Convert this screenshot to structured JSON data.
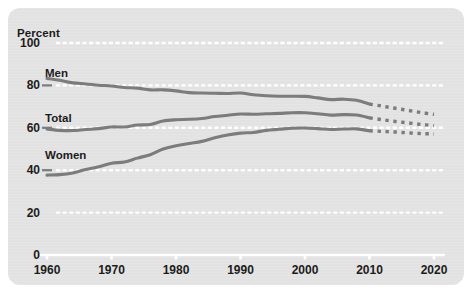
{
  "panel": {
    "background_color": "#e3e3e3",
    "border_radius": 12
  },
  "chart_data": {
    "type": "line",
    "title": "",
    "subtitle": "",
    "xlabel": "",
    "ylabel": "Percent",
    "ylim": [
      0,
      100
    ],
    "xlim": [
      1960,
      2020
    ],
    "grid": true,
    "grid_style": "dotted",
    "grid_color": "#ffffff",
    "legend_position": "inline-labels",
    "yticks": [
      100,
      80,
      60,
      40,
      20,
      0
    ],
    "ytick_labels": [
      "100",
      "80",
      "60",
      "40",
      "20",
      "0"
    ],
    "xticks": [
      1960,
      1970,
      1980,
      1990,
      2000,
      2010,
      2020
    ],
    "xtick_labels": [
      "1960",
      "1970",
      "1980",
      "1990",
      "2000",
      "2010",
      "2020"
    ],
    "line_color": "#7c7c7c",
    "projection_note": "dotted segments from 2010 to 2020 are projections",
    "series": [
      {
        "name": "Men",
        "label": "Men",
        "color": "#7c7c7c",
        "x": [
          1960,
          1962,
          1964,
          1966,
          1968,
          1970,
          1972,
          1974,
          1976,
          1978,
          1980,
          1982,
          1984,
          1986,
          1988,
          1990,
          1992,
          1994,
          1996,
          1998,
          2000,
          2002,
          2004,
          2006,
          2008,
          2010
        ],
        "values": [
          83.3,
          82.4,
          81.2,
          80.7,
          80.1,
          79.7,
          79.0,
          78.7,
          77.9,
          77.9,
          77.4,
          76.6,
          76.4,
          76.3,
          76.2,
          76.4,
          75.6,
          75.1,
          74.9,
          74.9,
          74.8,
          74.1,
          73.3,
          73.5,
          73.0,
          71.2
        ],
        "projection_x": [
          2010,
          2012,
          2014,
          2016,
          2018,
          2020
        ],
        "projection_values": [
          71.2,
          70.2,
          69.2,
          68.2,
          67.2,
          66.3
        ]
      },
      {
        "name": "Total",
        "label": "Total",
        "color": "#7c7c7c",
        "x": [
          1960,
          1962,
          1964,
          1966,
          1968,
          1970,
          1972,
          1974,
          1976,
          1978,
          1980,
          1982,
          1984,
          1986,
          1988,
          1990,
          1992,
          1994,
          1996,
          1998,
          2000,
          2002,
          2004,
          2006,
          2008,
          2010
        ],
        "values": [
          59.4,
          58.8,
          58.7,
          59.2,
          59.6,
          60.4,
          60.4,
          61.3,
          61.6,
          63.2,
          63.8,
          64.0,
          64.4,
          65.3,
          65.9,
          66.5,
          66.4,
          66.6,
          66.8,
          67.1,
          67.1,
          66.6,
          66.0,
          66.2,
          66.0,
          64.7
        ],
        "projection_x": [
          2010,
          2012,
          2014,
          2016,
          2018,
          2020
        ],
        "projection_values": [
          64.7,
          63.8,
          63.0,
          62.3,
          61.6,
          61.0
        ]
      },
      {
        "name": "Women",
        "label": "Women",
        "color": "#7c7c7c",
        "x": [
          1960,
          1962,
          1964,
          1966,
          1968,
          1970,
          1972,
          1974,
          1976,
          1978,
          1980,
          1982,
          1984,
          1986,
          1988,
          1990,
          1992,
          1994,
          1996,
          1998,
          2000,
          2002,
          2004,
          2006,
          2008,
          2010
        ],
        "values": [
          37.7,
          37.9,
          38.7,
          40.3,
          41.6,
          43.3,
          43.9,
          45.7,
          47.3,
          50.0,
          51.5,
          52.6,
          53.6,
          55.3,
          56.6,
          57.5,
          57.8,
          58.8,
          59.3,
          59.8,
          59.9,
          59.6,
          59.2,
          59.4,
          59.5,
          58.6
        ],
        "projection_x": [
          2010,
          2012,
          2014,
          2016,
          2018,
          2020
        ],
        "projection_values": [
          58.6,
          58.3,
          58.0,
          57.6,
          57.3,
          57.1
        ]
      }
    ]
  }
}
